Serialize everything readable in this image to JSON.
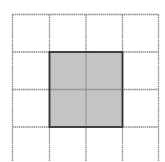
{
  "diagram": {
    "type": "grid",
    "rows_visible": 4,
    "cols": 4,
    "grid_x": [
      12.5,
      49.5,
      86,
      122.5,
      158.5
    ],
    "grid_y": [
      14.5,
      52,
      89.5,
      127
    ],
    "grid_bottom": 161,
    "shaded_region": {
      "col_start": 1,
      "col_end": 3,
      "row_start": 1,
      "row_end": 3,
      "label": "2x2 shaded square"
    },
    "colors": {
      "background": "#ffffff",
      "grid_line": "#8a8a8a",
      "shade_fill": "#c4c4c4",
      "shade_border": "#333333"
    }
  }
}
